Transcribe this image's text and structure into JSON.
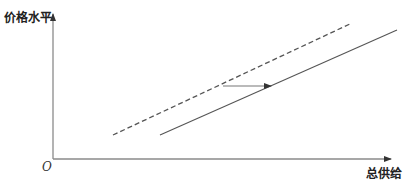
{
  "diagram": {
    "type": "aggregate-supply-shift",
    "y_axis_label": "价格水平",
    "x_axis_label": "总供给",
    "origin_label": "O",
    "colors": {
      "axis": "#8a8a8a",
      "line": "#555555",
      "text": "#222222"
    },
    "curves": [
      {
        "name": "original-supply-curve",
        "style": "dashed",
        "from": [
          113,
          135
        ],
        "to": [
          352,
          23
        ]
      },
      {
        "name": "shifted-supply-curve",
        "style": "solid",
        "from": [
          160,
          135
        ],
        "to": [
          397,
          30
        ]
      }
    ],
    "shift_arrow": {
      "direction": "right",
      "from": [
        223,
        86
      ],
      "to": [
        272,
        86
      ]
    }
  }
}
